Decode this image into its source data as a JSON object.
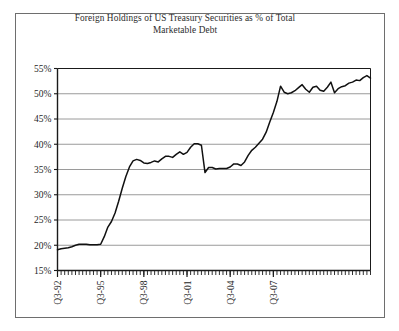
{
  "figure": {
    "title_line1": "Foreign Holdings of US Treasury Securities as % of Total",
    "title_line2": "Marketable Debt",
    "frame_color": "#6e6e6e",
    "grid_color": "#9a9a9a",
    "axis_color": "#1a1a1a",
    "line_color": "#111111",
    "background": "#ffffff"
  },
  "chart_data": {
    "type": "line",
    "title": "Foreign Holdings of US Treasury Securities as % of Total Marketable Debt",
    "xlabel": "",
    "ylabel": "",
    "ylim": [
      15,
      55
    ],
    "ytick_labels": [
      "15%",
      "20%",
      "25%",
      "30%",
      "35%",
      "40%",
      "45%",
      "50%",
      "55%"
    ],
    "ytick_values": [
      15,
      20,
      25,
      30,
      35,
      40,
      45,
      50,
      55
    ],
    "xtick_labels": [
      "Q3-92",
      "Q3-95",
      "Q3-98",
      "Q3-01",
      "Q3-04",
      "Q3-07"
    ],
    "xtick_values": [
      0,
      12,
      24,
      36,
      48,
      60
    ],
    "minor_ticks": "quarterly",
    "grid": "horizontal",
    "legend": "none",
    "x": [
      0,
      1,
      2,
      3,
      4,
      5,
      6,
      7,
      8,
      9,
      10,
      11,
      12,
      13,
      14,
      15,
      16,
      17,
      18,
      19,
      20,
      21,
      22,
      23,
      24,
      25,
      26,
      27,
      28,
      29,
      30,
      31,
      32,
      33,
      34,
      35,
      36,
      37,
      38,
      39,
      40,
      41,
      42,
      43,
      44,
      45,
      46,
      47,
      48,
      49,
      50,
      51,
      52,
      53,
      54,
      55,
      56,
      57,
      58,
      59,
      60,
      61,
      62,
      63,
      64,
      65,
      66
    ],
    "x_period_labels": [
      "Q3-92",
      "Q4-92",
      "Q1-93",
      "Q2-93",
      "Q3-93",
      "Q4-93",
      "Q1-94",
      "Q2-94",
      "Q3-94",
      "Q4-94",
      "Q1-95",
      "Q2-95",
      "Q3-95",
      "Q4-95",
      "Q1-96",
      "Q2-96",
      "Q3-96",
      "Q4-96",
      "Q1-97",
      "Q2-97",
      "Q3-97",
      "Q4-97",
      "Q1-98",
      "Q2-98",
      "Q3-98",
      "Q4-98",
      "Q1-99",
      "Q2-99",
      "Q3-99",
      "Q4-99",
      "Q1-00",
      "Q2-00",
      "Q3-00",
      "Q4-00",
      "Q1-01",
      "Q2-01",
      "Q3-01",
      "Q4-01",
      "Q1-02",
      "Q2-02",
      "Q3-02",
      "Q4-02",
      "Q1-03",
      "Q2-03",
      "Q3-03",
      "Q4-03",
      "Q1-04",
      "Q2-04",
      "Q3-04",
      "Q4-04",
      "Q1-05",
      "Q2-05",
      "Q3-05",
      "Q4-05",
      "Q1-06",
      "Q2-06",
      "Q3-06",
      "Q4-06",
      "Q1-07",
      "Q2-07",
      "Q3-07",
      "Q4-07",
      "Q1-08",
      "Q2-08",
      "Q3-08",
      "Q4-08",
      "Q1-09"
    ],
    "values": [
      19.1,
      19.3,
      19.4,
      19.5,
      19.7,
      20.0,
      20.2,
      20.2,
      20.2,
      20.1,
      20.1,
      20.1,
      20.2,
      21.7,
      23.6,
      24.7,
      26.4,
      28.7,
      31.3,
      33.6,
      35.5,
      36.7,
      37.0,
      36.8,
      36.3,
      36.2,
      36.4,
      36.7,
      36.5,
      37.1,
      37.6,
      37.6,
      37.4,
      38.0,
      38.5,
      38.0,
      38.4,
      39.4,
      40.1,
      40.1,
      39.8,
      34.4,
      35.4,
      35.4,
      35.1,
      35.2,
      35.2,
      35.2,
      35.5,
      36.1,
      36.1,
      35.8,
      36.5,
      37.8,
      38.8,
      39.4,
      40.2,
      41.0,
      42.4,
      44.4,
      46.3,
      48.5,
      51.5,
      50.3,
      50.0,
      50.2,
      50.6
    ],
    "values_tail": [
      51.2,
      51.8,
      50.9,
      50.3,
      51.3,
      51.5,
      50.7,
      50.5,
      51.3,
      52.3,
      50.2,
      51.0,
      51.4,
      51.6,
      52.1,
      52.3,
      52.7,
      52.6,
      53.2,
      53.6,
      53.1
    ]
  },
  "axis": {
    "y_min_label": "15%",
    "y_max_label": "55%"
  }
}
